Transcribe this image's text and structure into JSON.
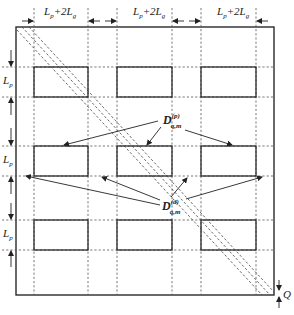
{
  "diagram": {
    "top_dimension_labels": [
      {
        "main": "L",
        "sub": "p",
        "rest": "+2L",
        "sub2": "g"
      },
      {
        "main": "L",
        "sub": "p",
        "rest": "+2L",
        "sub2": "g"
      },
      {
        "main": "L",
        "sub": "p",
        "rest": "+2L",
        "sub2": "g"
      }
    ],
    "left_dimension_labels": [
      {
        "main": "L",
        "sub": "p"
      },
      {
        "main": "L",
        "sub": "p"
      },
      {
        "main": "L",
        "sub": "p"
      }
    ],
    "pattern_label": {
      "main": "D",
      "sup": "(p)",
      "sub": "q,m"
    },
    "defect_label": {
      "main": "D",
      "sup": "(d)",
      "sub": "q,m"
    },
    "offset_label": "Q",
    "grid": {
      "rows": 3,
      "cols": 3
    },
    "colors": {
      "line": "#2a2a2a",
      "dash": "#555555",
      "background": "#ffffff"
    }
  }
}
